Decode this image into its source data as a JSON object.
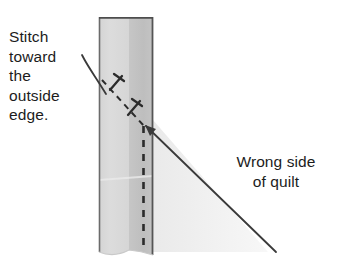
{
  "diagram": {
    "labels": {
      "stitch_instruction": "Stitch\ntoward\nthe\noutside\nedge.",
      "wrong_side": "Wrong side\nof quilt"
    },
    "colors": {
      "fabric_light": "#d9d9d9",
      "fabric_dark": "#c2c2c2",
      "fabric_shadow": "#e4e4e4",
      "outline": "#555555",
      "stitch_line": "#2b2b2b",
      "leader_line": "#3a3a3a",
      "text": "#1c1c1c",
      "background": "#ffffff"
    },
    "elements": {
      "fabric_strip": {
        "name": "quilt-binding-strip",
        "x": 99,
        "y": 17,
        "width": 54,
        "height": 238,
        "light_band_width": 30,
        "dark_band_width": 24
      },
      "vertical_stitch_line": {
        "name": "vertical-dashed-stitch-line",
        "x": 143,
        "y_start": 125,
        "y_end": 252,
        "dash": "7 6"
      },
      "diagonal_stitch_line": {
        "name": "diagonal-dashed-stitch-line",
        "x_start": 103,
        "y_start": 82,
        "x_end": 143,
        "y_end": 125,
        "dash": "6 5"
      },
      "stitch_marks": [
        {
          "name": "stitch-mark-upper",
          "x": 116,
          "y": 80
        },
        {
          "name": "stitch-mark-lower",
          "x": 134,
          "y": 105
        }
      ],
      "curved_leader": {
        "name": "stitch-instruction-leader-line",
        "from_x": 82,
        "from_y": 55,
        "to_x": 105,
        "to_y": 92
      },
      "wrong_side_leader": {
        "name": "wrong-side-leader-line",
        "arrow_x": 145,
        "arrow_y": 126,
        "end_x": 276,
        "end_y": 252
      }
    }
  }
}
